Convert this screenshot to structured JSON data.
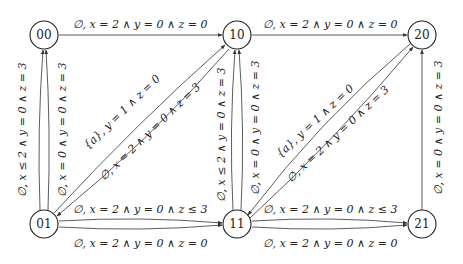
{
  "nodes": [
    {
      "id": "00",
      "label": "00"
    },
    {
      "id": "10",
      "label": "10"
    },
    {
      "id": "20",
      "label": "20"
    },
    {
      "id": "01",
      "label": "01"
    },
    {
      "id": "11",
      "label": "11"
    },
    {
      "id": "21",
      "label": "21"
    }
  ],
  "edges": {
    "e00_10": {
      "from": "00",
      "to": "10",
      "label": "∅, x = 2 ∧ y = 0 ∧ z = 0"
    },
    "e10_20": {
      "from": "10",
      "to": "20",
      "label": "∅, x = 2 ∧ y = 0 ∧ z = 0"
    },
    "e01_00_a": {
      "from": "01",
      "to": "00",
      "label": "∅, x ≤ 2 ∧ y = 0 ∧ z = 3"
    },
    "e01_00_b": {
      "from": "01",
      "to": "00",
      "label": "∅, x = 0 ∧ y = 0 ∧ z = 3"
    },
    "e01_10": {
      "from": "01",
      "to": "10",
      "label": "{a}, y = 1 ∧ z = 0"
    },
    "e10_01": {
      "from": "10",
      "to": "01",
      "label": "∅, x = 2 ∧ y = 0 ∧ z = 3"
    },
    "e11_10_a": {
      "from": "11",
      "to": "10",
      "label": "∅, x ≤ 2 ∧ y = 0 ∧ z = 3"
    },
    "e11_10_b": {
      "from": "11",
      "to": "10",
      "label": "∅, x = 0 ∧ y = 0 ∧ z = 3"
    },
    "e11_20": {
      "from": "11",
      "to": "20",
      "label": "{a}, y = 1 ∧ z = 0"
    },
    "e20_11": {
      "from": "20",
      "to": "11",
      "label": "∅, x = 2 ∧ y = 0 ∧ z = 3"
    },
    "e21_20": {
      "from": "21",
      "to": "20",
      "label": "∅, x = 0 ∧ y = 0 ∧ z = 3"
    },
    "e01_11_top": {
      "from": "01",
      "to": "11",
      "label": "∅, x = 2 ∧ y = 0 ∧ z ≤ 3"
    },
    "e01_11_bot": {
      "from": "01",
      "to": "11",
      "label": "∅, x = 2 ∧ y = 0 ∧ z = 0"
    },
    "e11_21_top": {
      "from": "11",
      "to": "21",
      "label": "∅, x = 2 ∧ y = 0 ∧ z ≤ 3"
    },
    "e11_21_bot": {
      "from": "11",
      "to": "21",
      "label": "∅, x = 2 ∧ y = 0 ∧ z = 0"
    }
  }
}
